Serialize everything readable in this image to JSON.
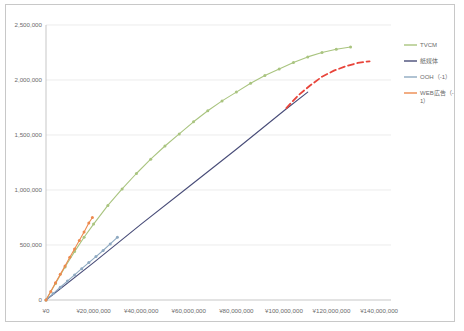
{
  "chart_data": {
    "type": "line",
    "title": "",
    "xlabel": "",
    "ylabel": "",
    "xlim": [
      0,
      145000000
    ],
    "ylim": [
      0,
      2500000
    ],
    "grid": true,
    "legend_position": "right",
    "y_ticks": [
      "0",
      "500,000",
      "1,000,000",
      "1,500,000",
      "2,000,000",
      "2,500,000"
    ],
    "y_tick_values": [
      0,
      500000,
      1000000,
      1500000,
      2000000,
      2500000
    ],
    "x_ticks": [
      "¥0",
      "¥20,000,000",
      "¥40,000,000",
      "¥60,000,000",
      "¥80,000,000",
      "¥100,000,000",
      "¥120,000,000",
      "¥140,000,000"
    ],
    "x_tick_values": [
      0,
      20000000,
      40000000,
      60000000,
      80000000,
      100000000,
      120000000,
      140000000
    ],
    "series": [
      {
        "name": "TVCM",
        "color": "#A9C47F",
        "style": "solid",
        "markers": true,
        "x": [
          0,
          4000000,
          8000000,
          12000000,
          16000000,
          20000000,
          26000000,
          32000000,
          38000000,
          44000000,
          50000000,
          56000000,
          62000000,
          68000000,
          74000000,
          80000000,
          86000000,
          92000000,
          98000000,
          104000000,
          110000000,
          116000000,
          122000000,
          128000000
        ],
        "y": [
          0,
          150000,
          300000,
          440000,
          570000,
          690000,
          860000,
          1010000,
          1150000,
          1280000,
          1400000,
          1510000,
          1620000,
          1720000,
          1810000,
          1890000,
          1970000,
          2040000,
          2100000,
          2160000,
          2210000,
          2250000,
          2280000,
          2300000
        ]
      },
      {
        "name": "紙媒体",
        "color": "#484C78",
        "style": "solid",
        "markers": false,
        "x": [
          0,
          20000000,
          40000000,
          60000000,
          80000000,
          100000000,
          110000000
        ],
        "y": [
          0,
          340000,
          690000,
          1030000,
          1370000,
          1720000,
          1890000
        ]
      },
      {
        "name": "OOH（-1）",
        "color": "#8EA9C1",
        "style": "solid",
        "markers": true,
        "x": [
          0,
          3000000,
          6000000,
          9000000,
          12000000,
          15000000,
          18000000,
          21000000,
          24000000,
          27000000,
          30000000
        ],
        "y": [
          0,
          58000,
          116000,
          172000,
          228000,
          285000,
          340000,
          395000,
          450000,
          510000,
          570000
        ]
      },
      {
        "name": "WEB広告（-1）",
        "color": "#ED8A4E",
        "style": "solid",
        "markers": true,
        "x": [
          0,
          2000000,
          4000000,
          6000000,
          8000000,
          10000000,
          12000000,
          14000000,
          16000000,
          18000000,
          19500000
        ],
        "y": [
          0,
          78000,
          156000,
          233000,
          310000,
          388000,
          464000,
          540000,
          618000,
          700000,
          750000
        ]
      },
      {
        "name": "trend-projection",
        "color": "#E8443A",
        "style": "dashed",
        "markers": false,
        "legend_hidden": true,
        "x": [
          101000000,
          106000000,
          111000000,
          116000000,
          121000000,
          126000000,
          131000000,
          136000000
        ],
        "y": [
          1745000,
          1860000,
          1950000,
          2030000,
          2085000,
          2125000,
          2155000,
          2170000
        ]
      }
    ],
    "legend_entries": [
      {
        "label": "TVCM",
        "color": "#A9C47F"
      },
      {
        "label": "紙媒体",
        "color": "#484C78"
      },
      {
        "label": "OOH（-1）",
        "color": "#8EA9C1"
      },
      {
        "label": "WEB広告（-",
        "label2": "1）",
        "color": "#ED8A4E"
      }
    ]
  }
}
